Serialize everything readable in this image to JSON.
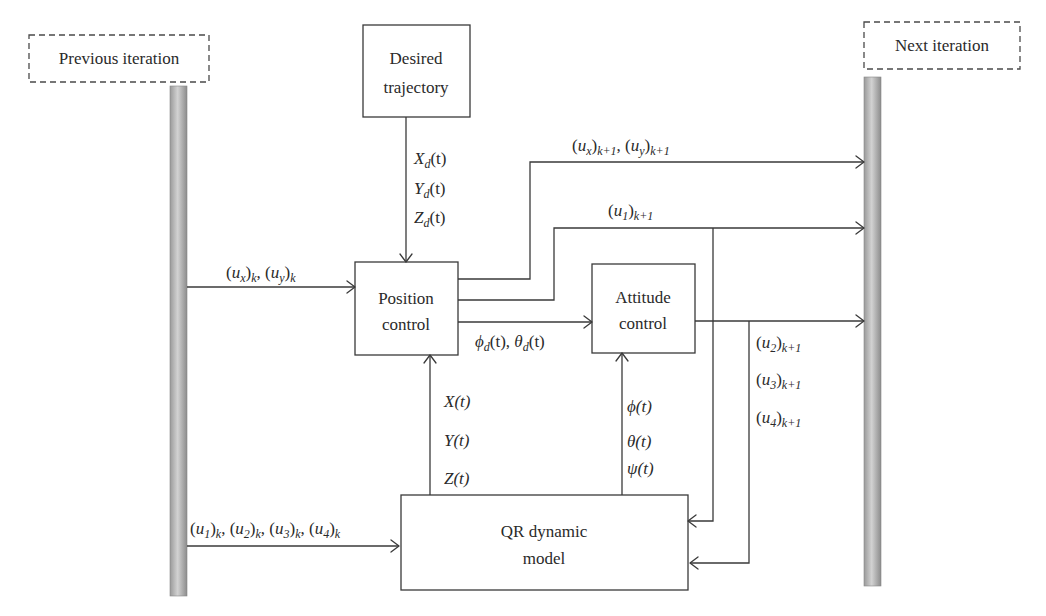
{
  "iteration_labels": {
    "previous": "Previous iteration",
    "next": "Next iteration"
  },
  "blocks": {
    "desired_trajectory": [
      "Desired",
      "trajectory"
    ],
    "position_control": [
      "Position",
      "control"
    ],
    "attitude_control": [
      "Attitude",
      "control"
    ],
    "qr_model": [
      "QR dynamic",
      "model"
    ]
  },
  "signals": {
    "desired": [
      {
        "base": "X",
        "sub": "d",
        "arg": "(t)"
      },
      {
        "base": "Y",
        "sub": "d",
        "arg": "(t)"
      },
      {
        "base": "Z",
        "sub": "d",
        "arg": "(t)"
      }
    ],
    "prev_position_input": [
      {
        "base": "(u",
        "sub1": "x",
        "close": ")",
        "sub2": "k"
      },
      {
        "base": "(u",
        "sub1": "y",
        "close": ")",
        "sub2": "k"
      }
    ],
    "next_position_output": [
      {
        "base": "(u",
        "sub1": "x",
        "close": ")",
        "sub2": "k+1"
      },
      {
        "base": "(u",
        "sub1": "y",
        "close": ")",
        "sub2": "k+1"
      }
    ],
    "next_thrust": {
      "base": "(u",
      "sub1": "1",
      "close": ")",
      "sub2": "k+1"
    },
    "desired_angles": [
      {
        "base": "ϕ",
        "sub": "d",
        "arg": "(t)"
      },
      {
        "base": "θ",
        "sub": "d",
        "arg": "(t)"
      }
    ],
    "attitude_outputs": [
      {
        "base": "(u",
        "sub1": "2",
        "close": ")",
        "sub2": "k+1"
      },
      {
        "base": "(u",
        "sub1": "3",
        "close": ")",
        "sub2": "k+1"
      },
      {
        "base": "(u",
        "sub1": "4",
        "close": ")",
        "sub2": "k+1"
      }
    ],
    "position_feedback": [
      "X(t)",
      "Y(t)",
      "Z(t)"
    ],
    "attitude_feedback": [
      "ϕ(t)",
      "θ(t)",
      "ψ(t)"
    ],
    "prev_model_input": [
      {
        "base": "(u",
        "sub1": "1",
        "close": ")",
        "sub2": "k"
      },
      {
        "base": "(u",
        "sub1": "2",
        "close": ")",
        "sub2": "k"
      },
      {
        "base": "(u",
        "sub1": "3",
        "close": ")",
        "sub2": "k"
      },
      {
        "base": "(u",
        "sub1": "4",
        "close": ")",
        "sub2": "k"
      }
    ]
  },
  "colors": {
    "line": "#3a3a3a",
    "bar_light": "#d4d4d4",
    "bar_dark": "#8a8a8a"
  }
}
